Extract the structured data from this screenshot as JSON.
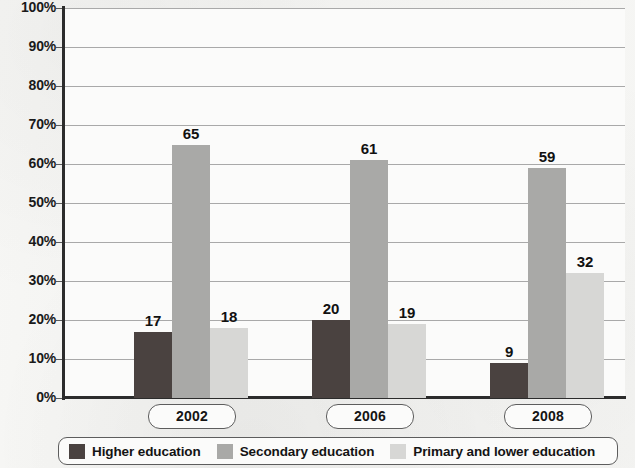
{
  "chart_data": {
    "type": "bar",
    "title": "",
    "subtitle": "",
    "xlabel": "",
    "ylabel": "",
    "categories": [
      "2002",
      "2006",
      "2008"
    ],
    "series": [
      {
        "name": "Higher education",
        "values": [
          17,
          20,
          9
        ],
        "color": "#4a4240"
      },
      {
        "name": "Secondary education",
        "values": [
          65,
          61,
          59
        ],
        "color": "#a9a9a7"
      },
      {
        "name": "Primary and lower education",
        "values": [
          18,
          19,
          32
        ],
        "color": "#d7d7d5"
      }
    ],
    "ylim": [
      0,
      100
    ],
    "ytick_values": [
      0,
      10,
      20,
      30,
      40,
      50,
      60,
      70,
      80,
      90,
      100
    ],
    "ytick_labels": [
      "0%",
      "10%",
      "20%",
      "30%",
      "40%",
      "50%",
      "60%",
      "70%",
      "80%",
      "90%",
      "100%"
    ],
    "grid": true,
    "grid_axis": "y",
    "legend_position": "bottom",
    "value_labels": true,
    "value_label_format": "integer"
  },
  "legend": {
    "items": [
      {
        "label": "Higher education",
        "color": "#4a4240"
      },
      {
        "label": "Secondary education",
        "color": "#a9a9a7"
      },
      {
        "label": "Primary and lower education",
        "color": "#d7d7d5"
      }
    ]
  },
  "colors": {
    "higher_education": "#4a4240",
    "secondary_education": "#a9a9a7",
    "primary_and_lower_education": "#d7d7d5",
    "axis": "#2c2c2c",
    "gridline": "#9a9a9a",
    "text": "#141414",
    "plot_background": "#fbfbfa",
    "page_background": "#f4f4f2"
  }
}
